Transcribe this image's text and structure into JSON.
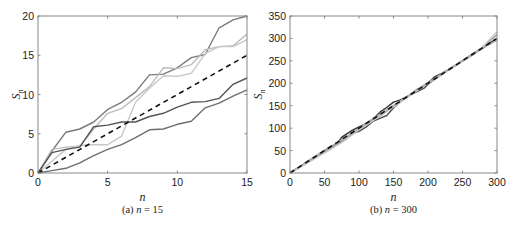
{
  "chart_data": [
    {
      "type": "line",
      "caption_prefix": "(a) ",
      "caption_var": "n",
      "caption_suffix": " = 15",
      "xlabel": "n",
      "ylabel": "S",
      "ylabel_sub": "n",
      "xlim": [
        0,
        15
      ],
      "ylim": [
        0,
        20
      ],
      "xticks": [
        0,
        5,
        10,
        15
      ],
      "yticks": [
        0,
        5,
        10,
        15,
        20
      ],
      "grid": false,
      "legend": null,
      "series": [
        {
          "name": "path-1",
          "color": "#7a7a7a",
          "dashed": false,
          "x": [
            0,
            1,
            2,
            3,
            4,
            5,
            6,
            7,
            8,
            9,
            10,
            11,
            12,
            13,
            14,
            15
          ],
          "values": [
            0,
            2.8,
            5.2,
            5.6,
            6.5,
            8.1,
            9.0,
            10.3,
            12.5,
            12.6,
            13.4,
            14.7,
            15.1,
            18.5,
            19.5,
            20.0
          ]
        },
        {
          "name": "path-2",
          "color": "#bdbdbd",
          "dashed": false,
          "x": [
            0,
            1,
            2,
            3,
            4,
            5,
            6,
            7,
            8,
            9,
            10,
            11,
            12,
            13,
            14,
            15
          ],
          "values": [
            0,
            3.0,
            3.3,
            3.4,
            5.6,
            7.6,
            8.2,
            9.6,
            11.0,
            13.4,
            13.3,
            13.8,
            15.7,
            16.1,
            16.2,
            17.7
          ]
        },
        {
          "name": "path-3",
          "color": "#c8c8c8",
          "dashed": false,
          "x": [
            0,
            1,
            2,
            3,
            4,
            5,
            6,
            7,
            8,
            9,
            10,
            11,
            12,
            13,
            14,
            15
          ],
          "values": [
            0,
            1.5,
            3.0,
            3.5,
            3.6,
            3.6,
            4.7,
            9.0,
            10.8,
            12.4,
            12.3,
            12.7,
            15.2,
            16.1,
            16.1,
            17.0
          ]
        },
        {
          "name": "path-4",
          "color": "#555555",
          "dashed": false,
          "x": [
            0,
            1,
            2,
            3,
            4,
            5,
            6,
            7,
            8,
            9,
            10,
            11,
            12,
            13,
            14,
            15
          ],
          "values": [
            0,
            2.6,
            3.0,
            3.3,
            5.9,
            6.1,
            6.5,
            6.5,
            7.2,
            7.6,
            8.4,
            9.0,
            9.1,
            9.5,
            11.3,
            12.1
          ]
        },
        {
          "name": "path-5",
          "color": "#6e6e6e",
          "dashed": false,
          "x": [
            0,
            1,
            2,
            3,
            4,
            5,
            6,
            7,
            8,
            9,
            10,
            11,
            12,
            13,
            14,
            15
          ],
          "values": [
            0,
            0.3,
            0.6,
            1.3,
            2.2,
            3.0,
            3.6,
            4.5,
            5.5,
            5.6,
            6.2,
            6.6,
            8.3,
            8.9,
            9.8,
            10.6
          ]
        },
        {
          "name": "mean",
          "color": "#111111",
          "dashed": true,
          "x": [
            0,
            15
          ],
          "values": [
            0,
            15
          ]
        }
      ]
    },
    {
      "type": "line",
      "caption_prefix": "(b) ",
      "caption_var": "n",
      "caption_suffix": " = 300",
      "xlabel": "n",
      "ylabel": "S",
      "ylabel_sub": "n",
      "xlim": [
        0,
        300
      ],
      "ylim": [
        0,
        350
      ],
      "xticks": [
        0,
        50,
        100,
        150,
        200,
        250,
        300
      ],
      "yticks": [
        0,
        50,
        100,
        150,
        200,
        250,
        300,
        350
      ],
      "grid": false,
      "legend": null,
      "series": [
        {
          "name": "path-1",
          "color": "#333333",
          "dashed": false,
          "x": [
            0,
            25,
            50,
            70,
            75,
            90,
            100,
            110,
            120,
            130,
            140,
            150,
            160,
            175,
            185,
            195,
            200,
            210,
            220,
            240,
            260,
            280,
            300
          ],
          "values": [
            0,
            25,
            50,
            68,
            80,
            95,
            103,
            110,
            120,
            135,
            146,
            158,
            163,
            175,
            187,
            195,
            200,
            215,
            222,
            240,
            260,
            280,
            300
          ]
        },
        {
          "name": "path-2",
          "color": "#444444",
          "dashed": false,
          "x": [
            0,
            25,
            50,
            70,
            80,
            90,
            100,
            110,
            120,
            130,
            140,
            150,
            160,
            175,
            185,
            195,
            200,
            220,
            240,
            260,
            280,
            300
          ],
          "values": [
            0,
            24,
            48,
            68,
            74,
            88,
            93,
            102,
            115,
            122,
            128,
            145,
            160,
            175,
            182,
            190,
            198,
            220,
            240,
            259,
            279,
            298
          ]
        },
        {
          "name": "path-3",
          "color": "#9a9a9a",
          "dashed": false,
          "x": [
            0,
            25,
            50,
            75,
            100,
            125,
            150,
            175,
            200,
            225,
            250,
            275,
            300
          ],
          "values": [
            0,
            23,
            47,
            70,
            98,
            124,
            150,
            176,
            202,
            226,
            251,
            276,
            308
          ]
        },
        {
          "name": "path-4",
          "color": "#c4c4c4",
          "dashed": false,
          "x": [
            0,
            25,
            50,
            75,
            100,
            125,
            150,
            175,
            200,
            225,
            250,
            275,
            300
          ],
          "values": [
            0,
            22,
            45,
            68,
            96,
            121,
            147,
            174,
            199,
            224,
            249,
            274,
            315
          ]
        },
        {
          "name": "path-5",
          "color": "#b0b0b0",
          "dashed": false,
          "x": [
            0,
            25,
            50,
            75,
            100,
            125,
            150,
            175,
            200,
            225,
            250,
            275,
            300
          ],
          "values": [
            0,
            26,
            51,
            74,
            100,
            126,
            151,
            175,
            200,
            226,
            250,
            275,
            296
          ]
        },
        {
          "name": "mean",
          "color": "#111111",
          "dashed": true,
          "x": [
            0,
            300
          ],
          "values": [
            0,
            300
          ]
        }
      ]
    }
  ],
  "panels": [
    {
      "frame": {
        "left": 38,
        "right": 247,
        "top": 16,
        "bottom": 173
      }
    },
    {
      "frame": {
        "left": 290,
        "right": 497,
        "top": 16,
        "bottom": 173
      }
    }
  ]
}
